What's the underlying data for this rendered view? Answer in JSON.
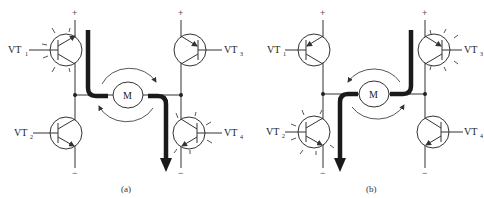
{
  "figure": {
    "panels": [
      {
        "id": "a",
        "caption": "(a)",
        "motor_label": "M",
        "supply_plus": "+",
        "supply_minus": "−",
        "transistors": [
          {
            "name": "VT",
            "sub": "1",
            "state": "on"
          },
          {
            "name": "VT",
            "sub": "2",
            "state": "off"
          },
          {
            "name": "VT",
            "sub": "3",
            "state": "off"
          },
          {
            "name": "VT",
            "sub": "4",
            "state": "on"
          }
        ],
        "current_path": "VT1 → M → VT4",
        "rotation": "clockwise"
      },
      {
        "id": "b",
        "caption": "(b)",
        "motor_label": "M",
        "supply_plus": "+",
        "supply_minus": "−",
        "transistors": [
          {
            "name": "VT",
            "sub": "1",
            "state": "off"
          },
          {
            "name": "VT",
            "sub": "2",
            "state": "on"
          },
          {
            "name": "VT",
            "sub": "3",
            "state": "on"
          },
          {
            "name": "VT",
            "sub": "4",
            "state": "off"
          }
        ],
        "current_path": "VT3 → M → VT2",
        "rotation": "counterclockwise"
      }
    ]
  }
}
